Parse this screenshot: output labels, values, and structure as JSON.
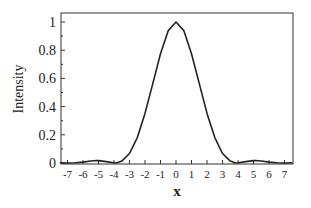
{
  "chart_data": {
    "type": "line",
    "title": "",
    "xlabel": "x",
    "ylabel": "Intensity",
    "xlim": [
      -7.5,
      7.5
    ],
    "ylim": [
      0,
      1.1
    ],
    "grid": false,
    "legend": null,
    "xticks": [
      -7,
      -6,
      -5,
      -4,
      -3,
      -2,
      -1,
      0,
      1,
      2,
      3,
      4,
      5,
      6,
      7
    ],
    "yticks": [
      0,
      0.2,
      0.4,
      0.6,
      0.8,
      1
    ],
    "ytick_labels": [
      "0",
      "0.2",
      "0.4",
      "0.6",
      "0.8",
      "1"
    ],
    "series": [
      {
        "name": "Intensity",
        "color": "#222222",
        "x": [
          -7.5,
          -7,
          -6.5,
          -6,
          -5.5,
          -5.14,
          -5,
          -4.5,
          -4,
          -3.83,
          -3.5,
          -3,
          -2.5,
          -2,
          -1.5,
          -1,
          -0.5,
          0,
          0.5,
          1,
          1.5,
          2,
          2.5,
          3,
          3.5,
          3.83,
          4,
          4.5,
          5,
          5.14,
          5.5,
          6,
          6.5,
          7,
          7.5
        ],
        "values": [
          0.0016,
          0.0,
          0.0011,
          0.0064,
          0.0145,
          0.0175,
          0.017,
          0.0098,
          0.0012,
          0.0,
          0.0138,
          0.0674,
          0.1799,
          0.3521,
          0.5634,
          0.7746,
          0.9388,
          1.0,
          0.9388,
          0.7746,
          0.5634,
          0.3521,
          0.1799,
          0.0674,
          0.0138,
          0.0,
          0.0012,
          0.0098,
          0.017,
          0.0175,
          0.0145,
          0.0064,
          0.0011,
          0.0,
          0.0016
        ]
      }
    ]
  }
}
